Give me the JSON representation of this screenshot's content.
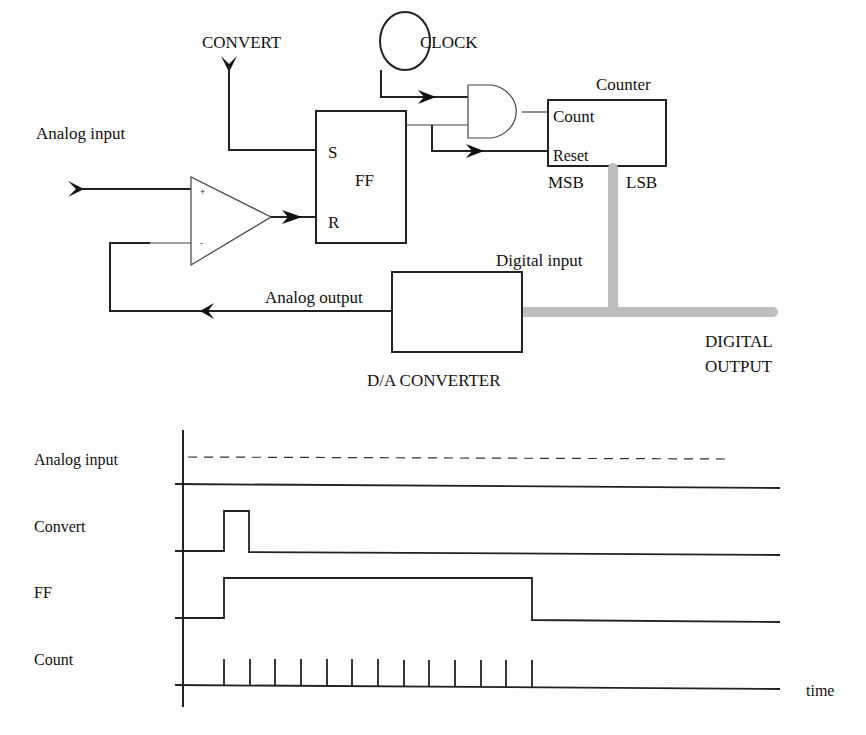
{
  "circuit": {
    "convert_label": "CONVERT",
    "clock_label": "CLOCK",
    "counter_label": "Counter",
    "counter_count_port": "Count",
    "counter_reset_port": "Reset",
    "msb_label": "MSB",
    "lsb_label": "LSB",
    "ff_label": "FF",
    "ff_set_port": "S",
    "ff_reset_port": "R",
    "analog_input_label": "Analog input",
    "comparator_plus": "+",
    "comparator_minus": "-",
    "digital_input_label": "Digital input",
    "analog_output_label": "Analog output",
    "dac_label": "D/A CONVERTER",
    "digital_output_line1": "DIGITAL",
    "digital_output_line2": "OUTPUT",
    "bus_color": "#bdbdbd"
  },
  "timing": {
    "rows": [
      {
        "label": "Analog input"
      },
      {
        "label": "Convert"
      },
      {
        "label": "FF"
      },
      {
        "label": "Count"
      }
    ],
    "time_label": "time",
    "count_pulses": 13
  }
}
